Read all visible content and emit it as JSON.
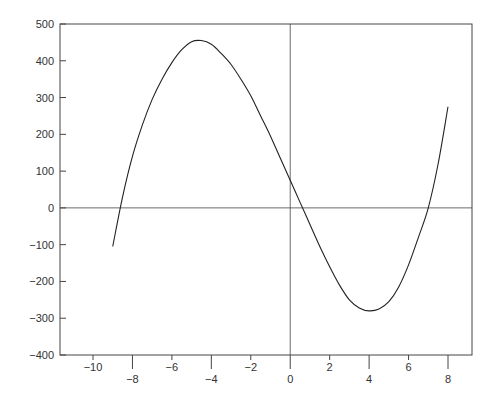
{
  "chart_data": {
    "type": "line",
    "title": "",
    "xlabel": "",
    "ylabel": "",
    "xlim": [
      -11.7,
      9.2
    ],
    "ylim": [
      -400,
      500
    ],
    "grid": false,
    "legend": null,
    "x_ticks_upper": [
      -10,
      -6,
      -2,
      2,
      6
    ],
    "x_ticks_lower": [
      -8,
      -4,
      0,
      4,
      8
    ],
    "y_ticks": [
      500,
      400,
      300,
      200,
      100,
      0,
      -100,
      -200,
      -300,
      -400
    ],
    "reference_lines": {
      "horizontal_y": 0,
      "vertical_x": 0
    },
    "series": [
      {
        "name": "f(x)",
        "description": "cubic curve with local max near (-5, 455), local min near (4, -280), roots near -8.7, 0.3, 7",
        "x": [
          -9,
          -8.5,
          -8,
          -7.5,
          -7,
          -6.5,
          -6,
          -5.5,
          -5,
          -4.5,
          -4,
          -3.5,
          -3,
          -2.5,
          -2,
          -1.5,
          -1,
          -0.5,
          0,
          0.5,
          1,
          1.5,
          2,
          2.5,
          3,
          3.5,
          4,
          4.5,
          5,
          5.5,
          6,
          6.5,
          7,
          7.5,
          8
        ],
        "y": [
          -105,
          30,
          140,
          225,
          295,
          350,
          395,
          430,
          452,
          455,
          445,
          420,
          390,
          350,
          305,
          250,
          195,
          135,
          75,
          15,
          -45,
          -105,
          -160,
          -210,
          -250,
          -272,
          -280,
          -275,
          -255,
          -215,
          -155,
          -80,
          0,
          120,
          275
        ]
      }
    ]
  },
  "colors": {
    "background": "#ffffff",
    "axis": "#444444",
    "curve": "#222222",
    "labels": "#333333"
  }
}
